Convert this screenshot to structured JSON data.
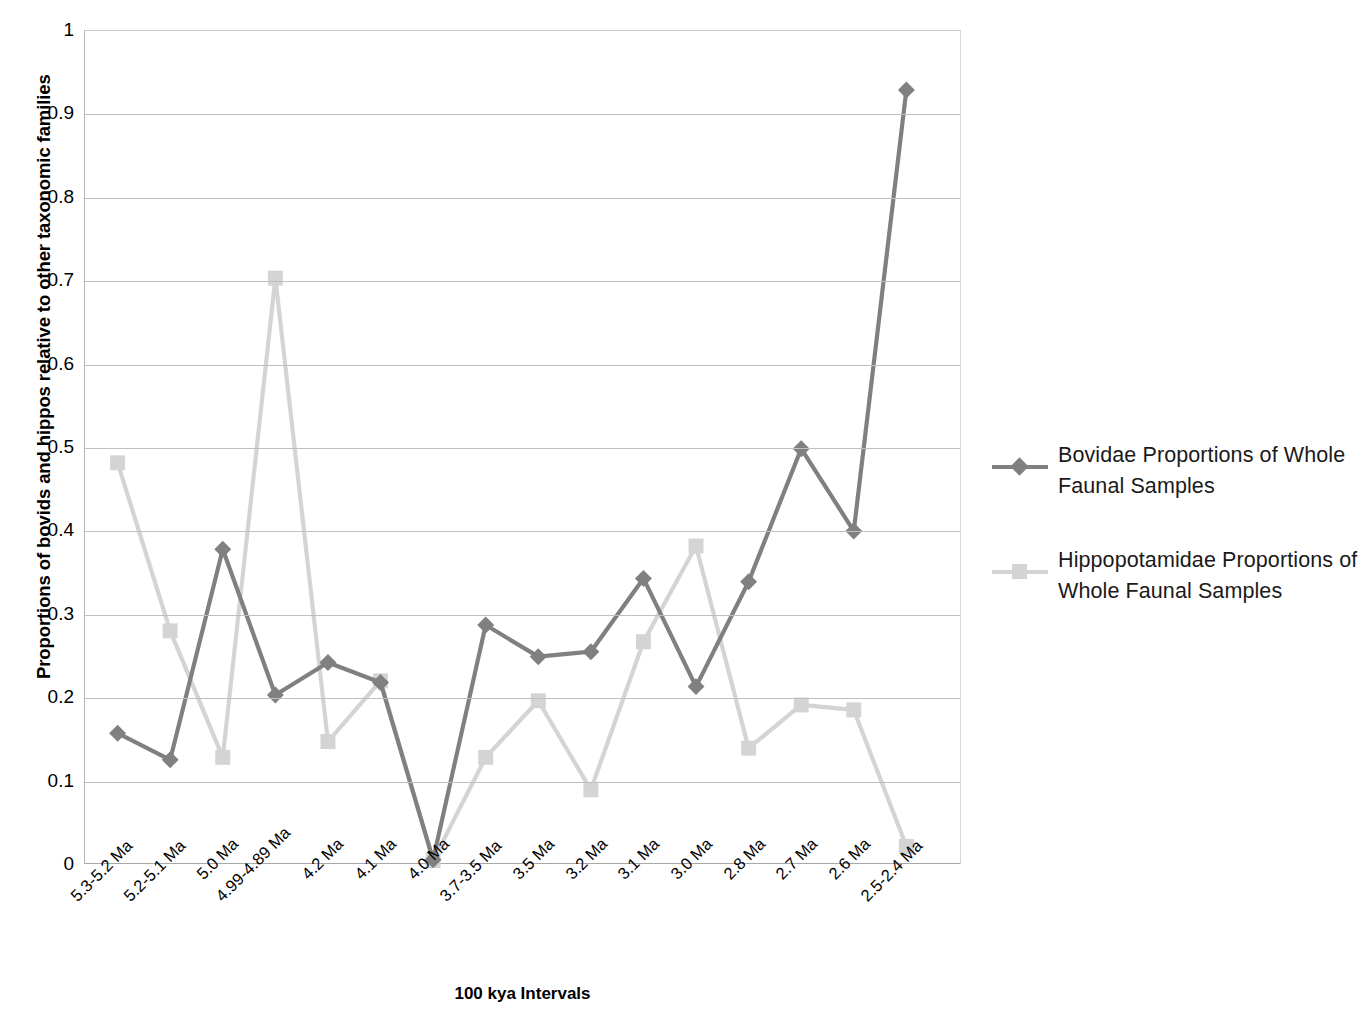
{
  "chart_data": {
    "type": "line",
    "title": "",
    "xlabel": "100 kya  Intervals",
    "ylabel": "Proportions of bovids and hippos relative to other taxonomic families",
    "ylim": [
      0,
      1
    ],
    "yticks": [
      "0",
      "0.1",
      "0.2",
      "0.3",
      "0.4",
      "0.5",
      "0.6",
      "0.7",
      "0.8",
      "0.9",
      "1"
    ],
    "grid": true,
    "legend_position": "right",
    "categories": [
      "5.3-5.2 Ma",
      "5.2-5.1 Ma",
      "5.0 Ma",
      "4.99-4.89 Ma",
      "4.2 Ma",
      "4.1 Ma",
      "4.0 Ma",
      "3.7-3.5 Ma",
      "3.5 Ma",
      "3.2 Ma",
      "3.1 Ma",
      "3.0 Ma",
      "2.8 Ma",
      "2.7 Ma",
      "2.6 Ma",
      "2.5-2.4 Ma"
    ],
    "series": [
      {
        "name": "Bovidae Proportions of Whole Faunal Samples",
        "color": "#808080",
        "marker": "diamond",
        "values": [
          0.156,
          0.124,
          0.377,
          0.202,
          0.241,
          0.217,
          0.004,
          0.286,
          0.248,
          0.254,
          0.342,
          0.212,
          0.338,
          0.498,
          0.399,
          0.929
        ]
      },
      {
        "name": "Hippopotamidae Proportions of Whole Faunal Samples",
        "color": "#d4d4d4",
        "marker": "square",
        "values": [
          0.481,
          0.279,
          0.127,
          0.703,
          0.146,
          0.219,
          0.003,
          0.127,
          0.195,
          0.088,
          0.266,
          0.381,
          0.138,
          0.19,
          0.184,
          0.02
        ]
      }
    ]
  },
  "legend": {
    "entries": [
      {
        "label": "Bovidae Proportions of Whole Faunal Samples"
      },
      {
        "label": "Hippopotamidae Proportions of Whole Faunal Samples"
      }
    ]
  }
}
